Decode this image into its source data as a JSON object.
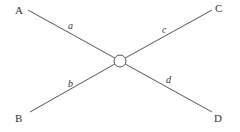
{
  "diagram": {
    "type": "crossing-lines",
    "nodes": [
      {
        "id": "A",
        "label": "A",
        "x": 20,
        "y": 14
      },
      {
        "id": "B",
        "label": "B",
        "x": 20,
        "y": 121
      },
      {
        "id": "C",
        "label": "C",
        "x": 220,
        "y": 12
      },
      {
        "id": "D",
        "label": "D",
        "x": 219,
        "y": 121
      }
    ],
    "center": {
      "x": 120,
      "y": 61,
      "r": 6
    },
    "edges": [
      {
        "id": "a",
        "label": "a",
        "from": "A",
        "to": "center"
      },
      {
        "id": "b",
        "label": "b",
        "from": "B",
        "to": "center"
      },
      {
        "id": "c",
        "label": "c",
        "from": "C",
        "to": "center"
      },
      {
        "id": "d",
        "label": "d",
        "from": "D",
        "to": "center"
      }
    ],
    "colors": {
      "line": "#555555",
      "text": "#333333",
      "background": "#ffffff"
    }
  }
}
